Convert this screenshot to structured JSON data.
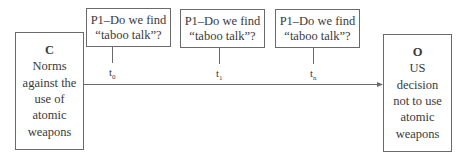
{
  "diagram": {
    "cause_box": {
      "letter": "C",
      "lines": [
        "Norms",
        "against the",
        "use of",
        "atomic",
        "weapons"
      ]
    },
    "outcome_box": {
      "letter": "O",
      "lines": [
        "US",
        "decision",
        "not to use",
        "atomic",
        "weapons"
      ]
    },
    "process_boxes": [
      {
        "line1": "P1–Do we find",
        "line2": "“taboo talk”?",
        "time_base": "t",
        "time_sub": "0"
      },
      {
        "line1": "P1–Do we find",
        "line2": "“taboo talk”?",
        "time_base": "t",
        "time_sub": "1"
      },
      {
        "line1": "P1–Do we find",
        "line2": "“taboo talk”?",
        "time_base": "t",
        "time_sub": "n"
      }
    ],
    "arrow": {
      "from": "C",
      "to": "O",
      "color": "#6a6a6a"
    }
  }
}
